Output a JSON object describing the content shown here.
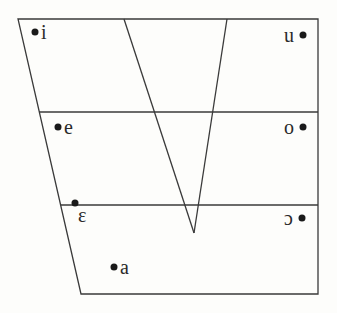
{
  "diagram": {
    "type": "vowel-quadrilateral",
    "outline": {
      "top_left": [
        18,
        19
      ],
      "top_right": [
        318,
        19
      ],
      "bottom_right": [
        318,
        294
      ],
      "bottom_left": [
        81,
        294
      ]
    },
    "horizontal_lines_y": [
      112,
      205
    ],
    "v_shape": {
      "left_top": [
        124,
        19
      ],
      "right_top": [
        227,
        19
      ],
      "bottom": [
        194,
        233
      ]
    },
    "vowels": [
      {
        "symbol": "i",
        "dot": [
          35,
          32
        ],
        "label_pos": [
          41,
          39
        ],
        "side": "left"
      },
      {
        "symbol": "u",
        "dot": [
          303,
          35
        ],
        "label_pos": [
          284,
          42
        ],
        "side": "right"
      },
      {
        "symbol": "e",
        "dot": [
          58,
          127
        ],
        "label_pos": [
          64,
          134
        ],
        "side": "left"
      },
      {
        "symbol": "o",
        "dot": [
          303,
          127
        ],
        "label_pos": [
          284,
          134
        ],
        "side": "right"
      },
      {
        "symbol": "ɛ",
        "dot": [
          75,
          203
        ],
        "label_pos": [
          78,
          222
        ],
        "side": "left"
      },
      {
        "symbol": "ɔ",
        "dot": [
          302,
          218
        ],
        "label_pos": [
          284,
          225
        ],
        "side": "right"
      },
      {
        "symbol": "a",
        "dot": [
          114,
          267
        ],
        "label_pos": [
          120,
          274
        ],
        "side": "left"
      }
    ]
  }
}
